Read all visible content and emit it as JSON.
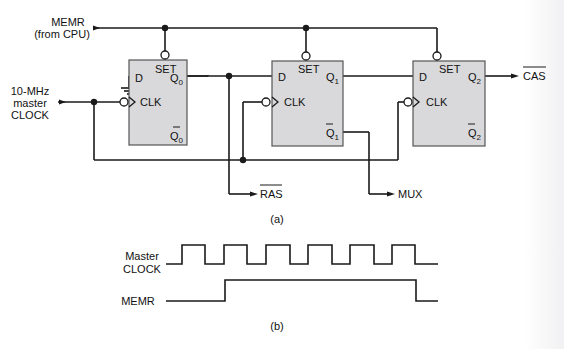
{
  "diagram": {
    "inputs": {
      "memr_label": "MEMR",
      "memr_sub": "(from CPU)",
      "clock_line1": "10-MHz",
      "clock_line2": "master",
      "clock_line3": "CLOCK"
    },
    "flipflops": [
      {
        "d": "D",
        "set": "SET",
        "clk": "CLK",
        "q": "Q",
        "q_sub": "0",
        "qbar": "Q",
        "qbar_sub": "0"
      },
      {
        "d": "D",
        "set": "SET",
        "clk": "CLK",
        "q": "Q",
        "q_sub": "1",
        "qbar": "Q",
        "qbar_sub": "1"
      },
      {
        "d": "D",
        "set": "SET",
        "clk": "CLK",
        "q": "Q",
        "q_sub": "2",
        "qbar": "Q",
        "qbar_sub": "2"
      }
    ],
    "outputs": {
      "cas": "CAS",
      "ras": "RAS",
      "mux": "MUX"
    },
    "caption_a": "(a)"
  },
  "timing": {
    "clock_label1": "Master",
    "clock_label2": "CLOCK",
    "memr_label": "MEMR",
    "caption_b": "(b)"
  },
  "colors": {
    "ff_fill": "#d9d9db",
    "line": "#1a1a1a"
  }
}
